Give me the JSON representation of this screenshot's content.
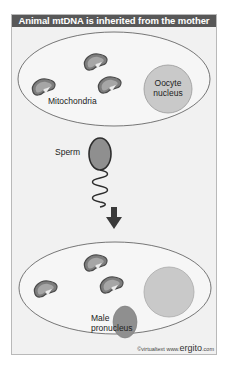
{
  "title": "Animal mtDNA is inherited from the mother",
  "top_cell": {
    "labels": {
      "mitochondria": "Mitochondria",
      "nucleus_line1": "Oocyte",
      "nucleus_line2": "nucleus"
    }
  },
  "sperm": {
    "label": "Sperm"
  },
  "bottom_cell": {
    "labels": {
      "pronucleus_line1": "Male",
      "pronucleus_line2": "pronucleus"
    }
  },
  "credit": {
    "prefix": "©virtualtext  www.",
    "brand": "ergito",
    "suffix": ".com"
  },
  "colors": {
    "header_bg": "#585858",
    "panel_bg": "#f1f1f1",
    "mito_fill": "#9a9a9a",
    "nucleus_fill": "#c9c9c9",
    "sperm_head": "#8f8f8f",
    "arrow": "#3a3a3a"
  }
}
